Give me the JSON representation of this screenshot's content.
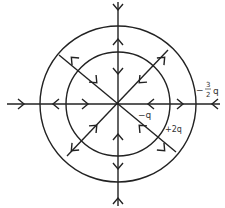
{
  "diagram": {
    "type": "electric-field-lines",
    "center": {
      "x": 118,
      "y": 104
    },
    "inner_circle_radius": 52,
    "outer_circle_radius": 78,
    "line_color": "#222222",
    "labels": {
      "center_charge": "−q",
      "inner_shell_charge": "+2q",
      "outer_shell_prefix": "−",
      "outer_shell_num": "3",
      "outer_shell_den": "2",
      "outer_shell_q": "q"
    },
    "field_directions": {
      "inside_inner": "inward",
      "between_shells": "outward",
      "outside_outer": "inward"
    }
  }
}
